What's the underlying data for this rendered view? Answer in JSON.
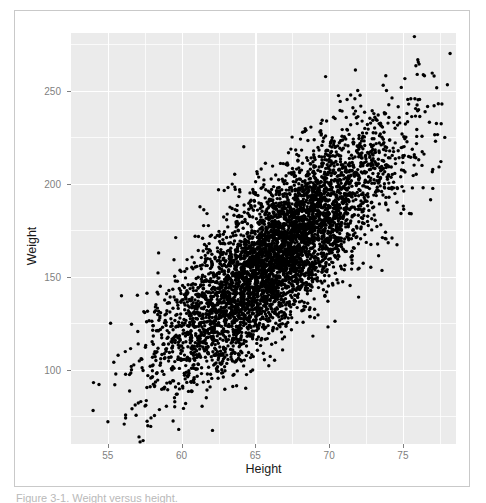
{
  "figure": {
    "caption": "Figure 3-1. Weight versus height."
  },
  "axes": {
    "x": {
      "title": "Height",
      "ticks": [
        55,
        60,
        65,
        70,
        75
      ],
      "tick_labels": [
        "55",
        "60",
        "65",
        "70",
        "75"
      ],
      "range": [
        52.5,
        78.6
      ]
    },
    "y": {
      "title": "Weight",
      "ticks": [
        100,
        150,
        200,
        250
      ],
      "tick_labels": [
        "100",
        "150",
        "200",
        "250"
      ],
      "range": [
        60,
        281
      ]
    }
  },
  "style": {
    "panel_fill": "#ebebeb",
    "gridline_color": "#ffffff",
    "point_color": "#000000",
    "tick_label_color": "#7f7f7f",
    "axis_title_color": "#1a1a1a",
    "card_border_color": "#c9c9c9",
    "page_background": "#ffffff"
  },
  "chart_data": {
    "type": "scatter",
    "title": "",
    "xlabel": "Height",
    "ylabel": "Weight",
    "xlim": [
      52.5,
      78.6
    ],
    "ylim": [
      60,
      281
    ],
    "xticks": [
      55,
      60,
      65,
      70,
      75
    ],
    "yticks": [
      100,
      150,
      200,
      250
    ],
    "grid": true,
    "legend": null,
    "n_points": 5000,
    "point_color": "#000000",
    "point_size": 3.4,
    "distribution": {
      "x_mean": 66.4,
      "x_sd": 3.85,
      "y_mean": 161.5,
      "y_sd": 32.1,
      "correlation": 0.8
    },
    "series": [
      {
        "name": "observations",
        "x": [
          54.2,
          55.0,
          55.6,
          56.1,
          56.6,
          57.0,
          57.4,
          57.9,
          58.2,
          58.6,
          58.9,
          59.2,
          59.5,
          59.8,
          60.1,
          60.4,
          60.7,
          61.0,
          61.2,
          61.5,
          61.8,
          62.0,
          62.3,
          62.5,
          62.8,
          63.0,
          63.3,
          63.5,
          63.8,
          64.0,
          64.2,
          64.5,
          64.7,
          65.0,
          65.2,
          65.5,
          65.7,
          66.0,
          66.2,
          66.5,
          66.7,
          67.0,
          67.2,
          67.5,
          67.8,
          68.0,
          68.3,
          68.5,
          68.8,
          69.0,
          69.3,
          69.6,
          69.9,
          70.2,
          70.5,
          70.8,
          71.1,
          71.5,
          71.9,
          72.3,
          72.7,
          73.2,
          73.7,
          74.3,
          74.9,
          75.6,
          76.4,
          77.2,
          78.0,
          78.4
        ],
        "y": [
          72,
          80,
          86,
          92,
          96,
          100,
          104,
          108,
          111,
          114,
          117,
          119,
          122,
          124,
          127,
          129,
          131,
          133,
          135,
          137,
          139,
          141,
          143,
          145,
          146,
          148,
          150,
          151,
          153,
          154,
          156,
          157,
          159,
          160,
          162,
          163,
          165,
          166,
          168,
          169,
          171,
          172,
          174,
          175,
          177,
          178,
          180,
          182,
          183,
          185,
          187,
          188,
          190,
          192,
          194,
          196,
          198,
          201,
          204,
          207,
          210,
          214,
          218,
          222,
          227,
          232,
          238,
          246,
          255,
          270
        ]
      }
    ]
  }
}
